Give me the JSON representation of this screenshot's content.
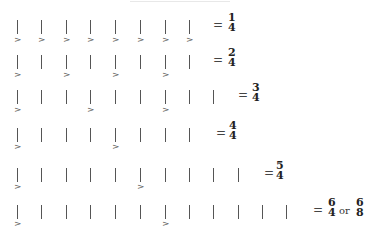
{
  "title_fragment": "",
  "rows": [
    {
      "id": "row-1-4",
      "top": 20,
      "beats": [
        18,
        42,
        67,
        91,
        116,
        141,
        166,
        190
      ],
      "accents": [
        0,
        1,
        2,
        3,
        4,
        5,
        6,
        7
      ],
      "equals_x": 213,
      "result": {
        "equals": "=",
        "fractions": [
          {
            "num": "1",
            "den": "4",
            "x": 228
          }
        ],
        "connector": ""
      }
    },
    {
      "id": "row-2-4",
      "top": 55,
      "beats": [
        18,
        42,
        67,
        91,
        116,
        141,
        166,
        190
      ],
      "accents": [
        0,
        2,
        4,
        6
      ],
      "equals_x": 213,
      "result": {
        "equals": "=",
        "fractions": [
          {
            "num": "2",
            "den": "4",
            "x": 228
          }
        ],
        "connector": ""
      }
    },
    {
      "id": "row-3-4",
      "top": 90,
      "beats": [
        18,
        42,
        67,
        91,
        116,
        141,
        166,
        190,
        214
      ],
      "accents": [
        0,
        3,
        6
      ],
      "equals_x": 238,
      "result": {
        "equals": "=",
        "fractions": [
          {
            "num": "3",
            "den": "4",
            "x": 252
          }
        ],
        "connector": ""
      }
    },
    {
      "id": "row-4-4",
      "top": 128,
      "beats": [
        18,
        42,
        67,
        91,
        116,
        141,
        166,
        190
      ],
      "accents": [
        0,
        4
      ],
      "equals_x": 216,
      "result": {
        "equals": "=",
        "fractions": [
          {
            "num": "4",
            "den": "4",
            "x": 229
          }
        ],
        "connector": ""
      }
    },
    {
      "id": "row-5-4",
      "top": 168,
      "beats": [
        18,
        42,
        67,
        91,
        116,
        141,
        166,
        190,
        214,
        239
      ],
      "accents": [
        0,
        5
      ],
      "equals_x": 264,
      "result": {
        "equals": "=",
        "fractions": [
          {
            "num": "5",
            "den": "4",
            "x": 276
          }
        ],
        "connector": ""
      }
    },
    {
      "id": "row-6-4-or-6-8",
      "top": 205,
      "beats": [
        18,
        42,
        67,
        91,
        116,
        141,
        166,
        190,
        214,
        239,
        263,
        287
      ],
      "accents": [
        0,
        6
      ],
      "equals_x": 313,
      "result": {
        "equals": "=",
        "fractions": [
          {
            "num": "6",
            "den": "4",
            "x": 328
          },
          {
            "num": "6",
            "den": "8",
            "x": 356
          }
        ],
        "connector": "or",
        "connector_x": 339
      }
    }
  ],
  "accent_glyph": ">",
  "colors": {
    "stem": "#555555",
    "text": "#222222",
    "background": "#ffffff"
  }
}
